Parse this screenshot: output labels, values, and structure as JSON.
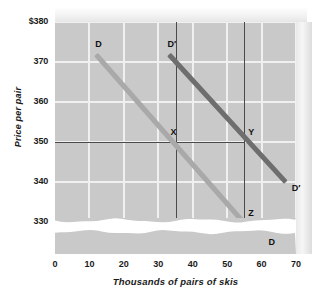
{
  "chart_data": {
    "type": "line",
    "title": "",
    "xlabel": "Thousands of pairs of skis",
    "ylabel": "Price per pair",
    "xlim": [
      0,
      70
    ],
    "ylim": [
      322,
      380
    ],
    "grid": true,
    "legend_position": "inline-endpoint-labels",
    "x_ticks": [
      "0",
      "10",
      "20",
      "30",
      "40",
      "50",
      "60",
      "70"
    ],
    "x_tick_values": [
      0,
      10,
      20,
      30,
      40,
      50,
      60,
      70
    ],
    "y_ticks": [
      "$380",
      "370",
      "360",
      "350",
      "340",
      "330"
    ],
    "y_tick_values": [
      380,
      370,
      360,
      350,
      340,
      330
    ],
    "axis_break": "wavy break between 330 and 0 on price axis",
    "series": [
      {
        "name": "D",
        "label": "D",
        "color": "#a9a9a9",
        "start_label": "D",
        "end_label": "D",
        "points": [
          {
            "x": 12,
            "y": 372
          },
          {
            "x": 60,
            "y": 325
          }
        ]
      },
      {
        "name": "D'",
        "label": "D′",
        "color": "#6e6e6e",
        "start_label": "D′",
        "end_label": "D′",
        "points": [
          {
            "x": 33,
            "y": 372
          },
          {
            "x": 67,
            "y": 340
          }
        ]
      }
    ],
    "annotations": [
      {
        "label": "X",
        "x": 35,
        "y": 350,
        "on_series": "D"
      },
      {
        "label": "Y",
        "x": 55,
        "y": 350,
        "on_series": "D′"
      },
      {
        "label": "Z",
        "x": 55,
        "y": 330,
        "on_series": "D"
      }
    ],
    "reference_lines": {
      "horizontal": [
        350,
        330
      ],
      "vertical": [
        35,
        55
      ]
    }
  },
  "colors": {
    "plot_background": "#c9c9c9",
    "gridline": "#f0f0f0",
    "reference_line": "#4a4a4a",
    "demand_d": "#a9a9a9",
    "demand_d_prime": "#6e6e6e",
    "text": "#1a1a1a",
    "page_background": "#ffffff"
  }
}
